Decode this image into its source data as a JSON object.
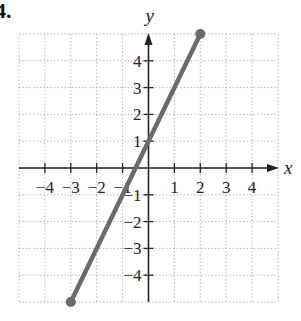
{
  "problem_number": "4.",
  "chart_data": {
    "type": "line",
    "title": "",
    "xlabel": "x",
    "ylabel": "y",
    "xlim": [
      -5,
      5
    ],
    "ylim": [
      -5,
      5
    ],
    "grid": true,
    "x_ticks": [
      -4,
      -3,
      -2,
      -1,
      1,
      2,
      3,
      4
    ],
    "y_ticks": [
      -4,
      -3,
      -2,
      -1,
      1,
      2,
      3,
      4
    ],
    "x_tick_labels": [
      "−4",
      "−3",
      "−2",
      "−1",
      "1",
      "2",
      "3",
      "4"
    ],
    "y_tick_labels": [
      "−4",
      "−3",
      "−2",
      "−1",
      "1",
      "2",
      "3",
      "4"
    ],
    "series": [
      {
        "name": "line segment",
        "x": [
          -3,
          2
        ],
        "y": [
          -5,
          5
        ],
        "color": "#6b6b6b",
        "endpoints": "closed"
      }
    ]
  },
  "colors": {
    "grid": "#b5b5b5",
    "axis": "#222222",
    "line": "#6b6b6b"
  }
}
